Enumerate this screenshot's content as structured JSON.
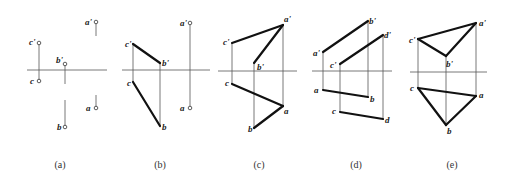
{
  "figures": [
    {
      "id": "a",
      "caption": "(a)",
      "axis": {
        "x1": 27,
        "x2": 107,
        "y": 70
      },
      "points": [
        {
          "name": "c'",
          "x": 39,
          "y": 43,
          "circle": true,
          "lx": 29,
          "ly": 45
        },
        {
          "name": "c",
          "x": 39,
          "y": 81,
          "circle": true,
          "lx": 30,
          "ly": 84
        },
        {
          "name": "b'",
          "x": 65,
          "y": 64,
          "circle": true,
          "lx": 56,
          "ly": 63
        },
        {
          "name": "b",
          "x": 65,
          "y": 127,
          "circle": true,
          "lx": 57,
          "ly": 130
        },
        {
          "name": "a'",
          "x": 96,
          "y": 22,
          "circle": true,
          "lx": 85,
          "ly": 25
        },
        {
          "name": "a",
          "x": 96,
          "y": 108,
          "circle": true,
          "lx": 86,
          "ly": 111
        }
      ],
      "thin_lines": [
        [
          39,
          43,
          39,
          81
        ],
        [
          65,
          64,
          65,
          84
        ],
        [
          65,
          100,
          65,
          127
        ],
        [
          96,
          22,
          96,
          36
        ],
        [
          96,
          95,
          96,
          108
        ]
      ],
      "thick_lines": []
    },
    {
      "id": "b",
      "caption": "(b)",
      "axis": {
        "x1": 122,
        "x2": 210,
        "y": 70
      },
      "points": [
        {
          "name": "c'",
          "x": 133,
          "y": 44,
          "circle": false,
          "lx": 125,
          "ly": 47
        },
        {
          "name": "c",
          "x": 133,
          "y": 82,
          "circle": false,
          "lx": 127,
          "ly": 86
        },
        {
          "name": "b'",
          "x": 160,
          "y": 63,
          "circle": false,
          "lx": 162,
          "ly": 66
        },
        {
          "name": "b",
          "x": 160,
          "y": 126,
          "circle": false,
          "lx": 162,
          "ly": 130
        },
        {
          "name": "a'",
          "x": 190,
          "y": 23,
          "circle": true,
          "lx": 180,
          "ly": 26
        },
        {
          "name": "a",
          "x": 190,
          "y": 108,
          "circle": true,
          "lx": 180,
          "ly": 111
        }
      ],
      "thin_lines": [
        [
          133,
          44,
          133,
          82
        ],
        [
          160,
          63,
          160,
          126
        ],
        [
          190,
          23,
          190,
          108
        ]
      ],
      "thick_lines": [
        [
          133,
          44,
          160,
          63
        ],
        [
          133,
          82,
          160,
          126
        ]
      ]
    },
    {
      "id": "c",
      "caption": "(c)",
      "axis": {
        "x1": 218,
        "x2": 297,
        "y": 71
      },
      "points": [
        {
          "name": "a'",
          "x": 283,
          "y": 25,
          "circle": false,
          "lx": 284,
          "ly": 22
        },
        {
          "name": "a",
          "x": 283,
          "y": 106,
          "circle": false,
          "lx": 284,
          "ly": 114
        },
        {
          "name": "c'",
          "x": 232,
          "y": 43,
          "circle": false,
          "lx": 223,
          "ly": 45
        },
        {
          "name": "c",
          "x": 232,
          "y": 84,
          "circle": false,
          "lx": 225,
          "ly": 86
        },
        {
          "name": "b'",
          "x": 254,
          "y": 63,
          "circle": false,
          "lx": 257,
          "ly": 70
        },
        {
          "name": "b",
          "x": 254,
          "y": 128,
          "circle": false,
          "lx": 248,
          "ly": 132
        }
      ],
      "thin_lines": [
        [
          232,
          43,
          232,
          84
        ],
        [
          254,
          63,
          254,
          128
        ],
        [
          283,
          25,
          283,
          106
        ]
      ],
      "thick_lines": [
        [
          232,
          43,
          283,
          25
        ],
        [
          283,
          25,
          254,
          63
        ],
        [
          232,
          84,
          283,
          106
        ],
        [
          283,
          106,
          254,
          128
        ]
      ]
    },
    {
      "id": "d",
      "caption": "(d)",
      "axis": {
        "x1": 312,
        "x2": 392,
        "y": 71
      },
      "points": [
        {
          "name": "b'",
          "x": 368,
          "y": 21,
          "circle": false,
          "lx": 369,
          "ly": 24
        },
        {
          "name": "b",
          "x": 368,
          "y": 97,
          "circle": false,
          "lx": 370,
          "ly": 102
        },
        {
          "name": "a'",
          "x": 323,
          "y": 52,
          "circle": false,
          "lx": 313,
          "ly": 56
        },
        {
          "name": "a",
          "x": 323,
          "y": 90,
          "circle": false,
          "lx": 314,
          "ly": 93
        },
        {
          "name": "d'",
          "x": 383,
          "y": 35,
          "circle": false,
          "lx": 384,
          "ly": 38
        },
        {
          "name": "d",
          "x": 383,
          "y": 119,
          "circle": false,
          "lx": 385,
          "ly": 123
        },
        {
          "name": "c'",
          "x": 340,
          "y": 64,
          "circle": false,
          "lx": 330,
          "ly": 68
        },
        {
          "name": "c",
          "x": 340,
          "y": 112,
          "circle": false,
          "lx": 332,
          "ly": 114
        }
      ],
      "thin_lines": [
        [
          323,
          52,
          323,
          90
        ],
        [
          340,
          64,
          340,
          112
        ],
        [
          368,
          21,
          368,
          97
        ],
        [
          383,
          35,
          383,
          119
        ]
      ],
      "thick_lines": [
        [
          323,
          52,
          368,
          21
        ],
        [
          340,
          64,
          383,
          35
        ],
        [
          323,
          90,
          368,
          97
        ],
        [
          340,
          112,
          383,
          119
        ]
      ]
    },
    {
      "id": "e",
      "caption": "(e)",
      "axis": {
        "x1": 410,
        "x2": 487,
        "y": 72
      },
      "points": [
        {
          "name": "a'",
          "x": 476,
          "y": 23,
          "circle": false,
          "lx": 479,
          "ly": 26
        },
        {
          "name": "a",
          "x": 476,
          "y": 96,
          "circle": false,
          "lx": 479,
          "ly": 98
        },
        {
          "name": "c'",
          "x": 418,
          "y": 39,
          "circle": false,
          "lx": 409,
          "ly": 43
        },
        {
          "name": "c",
          "x": 418,
          "y": 88,
          "circle": false,
          "lx": 410,
          "ly": 91
        },
        {
          "name": "b'",
          "x": 446,
          "y": 56,
          "circle": false,
          "lx": 446,
          "ly": 67
        },
        {
          "name": "b",
          "x": 446,
          "y": 125,
          "circle": false,
          "lx": 447,
          "ly": 134
        }
      ],
      "thin_lines": [
        [
          418,
          39,
          418,
          88
        ],
        [
          446,
          56,
          446,
          125
        ],
        [
          476,
          23,
          476,
          96
        ]
      ],
      "thick_lines": [
        [
          418,
          39,
          476,
          23
        ],
        [
          476,
          23,
          446,
          56
        ],
        [
          446,
          56,
          418,
          39
        ],
        [
          418,
          88,
          476,
          96
        ],
        [
          476,
          96,
          446,
          125
        ],
        [
          446,
          125,
          418,
          88
        ]
      ]
    }
  ],
  "captions": [
    {
      "text": "(a)",
      "x": 60,
      "y": 168
    },
    {
      "text": "(b)",
      "x": 160,
      "y": 168
    },
    {
      "text": "(c)",
      "x": 259,
      "y": 168
    },
    {
      "text": "(d)",
      "x": 356,
      "y": 168
    },
    {
      "text": "(e)",
      "x": 452,
      "y": 168
    }
  ]
}
